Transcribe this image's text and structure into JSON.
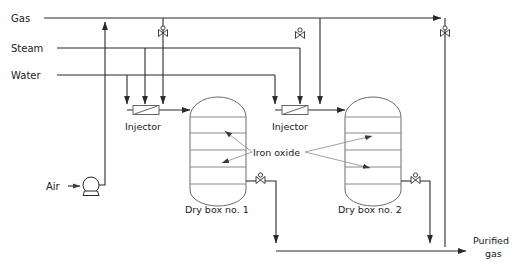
{
  "diagram": {
    "type": "process-flow-diagram",
    "colors": {
      "line": "#2b2b2b",
      "vessel": "#6b6b6b",
      "tray": "#8a8a8a",
      "leader": "#8a8a8a",
      "text": "#1a1a1a",
      "background": "#ffffff"
    },
    "inlets": [
      {
        "id": "gas",
        "label": "Gas",
        "y": 18
      },
      {
        "id": "steam",
        "label": "Steam",
        "y": 48
      },
      {
        "id": "water",
        "label": "Water",
        "y": 75
      }
    ],
    "air_feed": {
      "label": "Air",
      "pump_icon": "centrifugal-blower-icon"
    },
    "injectors": [
      {
        "id": "injector-1",
        "label": "Injector"
      },
      {
        "id": "injector-2",
        "label": "Injector"
      }
    ],
    "vessels": [
      {
        "id": "dry-box-1",
        "label": "Dry box no. 1",
        "trays": 4
      },
      {
        "id": "dry-box-2",
        "label": "Dry box no. 2",
        "trays": 4
      }
    ],
    "bed_label": "Iron oxide",
    "outlet": {
      "label_line1": "Purified",
      "label_line2": "gas"
    },
    "valves": [
      {
        "id": "valve-gas-branch-1",
        "icon": "gate-valve-icon"
      },
      {
        "id": "valve-gas-branch-2",
        "icon": "gate-valve-icon"
      },
      {
        "id": "valve-gas-bypass",
        "icon": "gate-valve-icon"
      },
      {
        "id": "valve-outlet-box-1",
        "icon": "gate-valve-icon"
      },
      {
        "id": "valve-outlet-box-2",
        "icon": "gate-valve-icon"
      }
    ]
  }
}
